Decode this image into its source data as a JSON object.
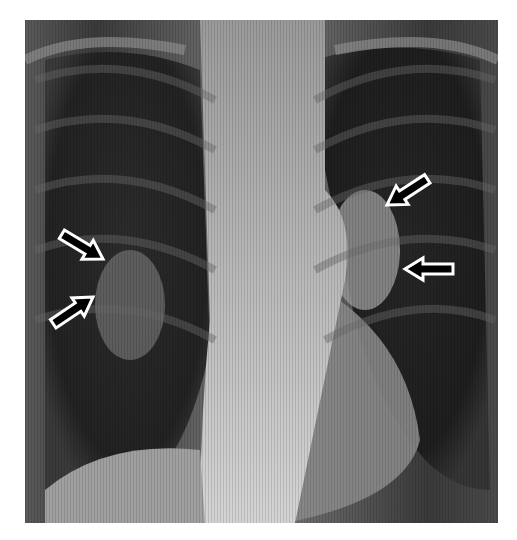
{
  "image": {
    "subject": "chest-xray-pa-view",
    "background": "#ffffff",
    "frame": {
      "x": 25,
      "y": 20,
      "width": 473,
      "height": 503
    }
  },
  "annotations": [
    {
      "name": "arrow-right-hilum-upper",
      "direction": "down-right",
      "tail": [
        58,
        232
      ],
      "tip": [
        103,
        259
      ]
    },
    {
      "name": "arrow-right-hilum-lower",
      "direction": "up-right",
      "tail": [
        48,
        327
      ],
      "tip": [
        93,
        297
      ]
    },
    {
      "name": "arrow-left-hilum-upper",
      "direction": "down-left",
      "tail": [
        429,
        178
      ],
      "tip": [
        387,
        205
      ]
    },
    {
      "name": "arrow-left-hilum-lower",
      "direction": "left",
      "tail": [
        453,
        269
      ],
      "tip": [
        405,
        269
      ]
    }
  ],
  "colors": {
    "arrow_fill": "#000000",
    "arrow_stroke": "#ffffff",
    "lung_dark": "#1e1e1e",
    "mediastinum": "#c8c8c8",
    "soft_tissue": "#8a8a8a"
  }
}
